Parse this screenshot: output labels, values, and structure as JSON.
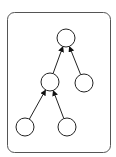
{
  "diagram": {
    "type": "tree",
    "frame": {
      "x": 7,
      "y": 12,
      "width": 103,
      "height": 140,
      "radius": 7,
      "stroke": "#555555"
    },
    "node_radius": 9,
    "stroke_color": "#222222",
    "nodes": [
      {
        "id": "root",
        "cx": 66,
        "cy": 38
      },
      {
        "id": "mid-left",
        "cx": 50,
        "cy": 82
      },
      {
        "id": "mid-right",
        "cx": 84,
        "cy": 83
      },
      {
        "id": "leaf-left",
        "cx": 25,
        "cy": 127
      },
      {
        "id": "leaf-right",
        "cx": 67,
        "cy": 127
      }
    ],
    "edges": [
      {
        "from": "mid-left",
        "to": "root",
        "arrow": "to"
      },
      {
        "from": "mid-right",
        "to": "root",
        "arrow": "to"
      },
      {
        "from": "leaf-left",
        "to": "mid-left",
        "arrow": "to"
      },
      {
        "from": "leaf-right",
        "to": "mid-left",
        "arrow": "to"
      }
    ]
  }
}
